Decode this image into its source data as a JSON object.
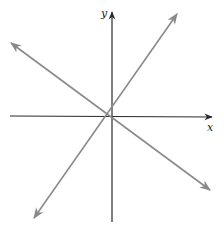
{
  "diagram": {
    "type": "coordinate-plane",
    "axes": {
      "x_label": "x",
      "y_label": "y",
      "color": "#2a2a2a"
    },
    "lines": [
      {
        "name": "positive-slope-line",
        "description": "line through origin rising left to right",
        "color": "#8a8a8a"
      },
      {
        "name": "negative-slope-line",
        "description": "line through origin falling left to right",
        "color": "#8a8a8a"
      }
    ]
  }
}
